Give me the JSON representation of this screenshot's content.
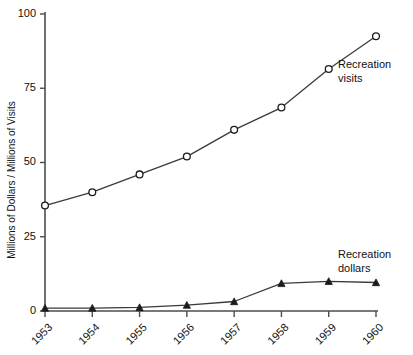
{
  "chart_data": {
    "type": "line",
    "title": "",
    "xlabel": "",
    "ylabel": "Millions of Dollars / Millions of Visits",
    "categories": [
      "1953",
      "1954",
      "1955",
      "1956",
      "1957",
      "1958",
      "1959",
      "1960"
    ],
    "xtick_rotation": -45,
    "ylim": [
      0,
      100
    ],
    "yticks": [
      0,
      25,
      50,
      75,
      100
    ],
    "ytick_labels": [
      "0",
      "25",
      "50",
      "75",
      "100"
    ],
    "grid": false,
    "legend_position": "inline-right",
    "series": [
      {
        "name": "Recreation visits",
        "marker": "open-circle",
        "label_lines": [
          "Recreation",
          "visits"
        ],
        "values": [
          35.5,
          40,
          46,
          52,
          61,
          68.5,
          81.5,
          92.5
        ]
      },
      {
        "name": "Recreation dollars",
        "marker": "filled-triangle",
        "label_lines": [
          "Recreation",
          "dollars"
        ],
        "values": [
          1,
          1,
          1.2,
          2,
          3.2,
          9.3,
          10,
          9.6
        ]
      }
    ]
  },
  "annotations": {
    "visits_label_line1": "Recreation",
    "visits_label_line2": "visits",
    "dollars_label_line1": "Recreation",
    "dollars_label_line2": "dollars"
  },
  "colors": {
    "line": "#3a3a3a",
    "axis": "#4d4d4d",
    "text": "#111111",
    "background": "#ffffff"
  }
}
